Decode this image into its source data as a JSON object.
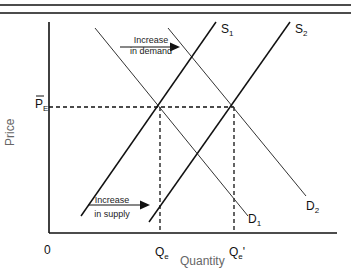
{
  "diagram": {
    "axes": {
      "x_label": "Quantity",
      "y_label": "Price",
      "origin": "0"
    },
    "price_label": {
      "main": "P",
      "sub": "E",
      "bar": true
    },
    "quantity_labels": [
      {
        "main": "Q",
        "sub": "e",
        "prime": ""
      },
      {
        "main": "Q",
        "sub": "e",
        "prime": "'"
      }
    ],
    "curves": [
      {
        "name": "S",
        "sub": "1",
        "type": "supply"
      },
      {
        "name": "S",
        "sub": "2",
        "type": "supply"
      },
      {
        "name": "D",
        "sub": "1",
        "type": "demand"
      },
      {
        "name": "D",
        "sub": "2",
        "type": "demand"
      }
    ],
    "annotations": {
      "demand_shift": {
        "line1": "Increase",
        "line2": "in demand"
      },
      "supply_shift": {
        "line1": "Increase",
        "line2": "in supply"
      }
    },
    "colors": {
      "line": "#111111",
      "demand_line": "#333333",
      "axis_title": "#666666"
    }
  }
}
